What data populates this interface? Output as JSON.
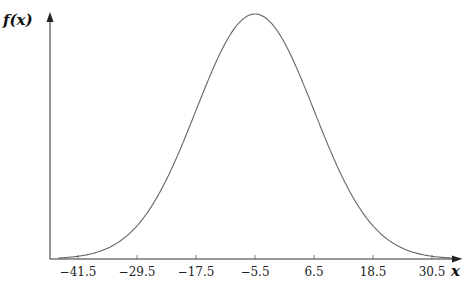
{
  "chart_data": {
    "type": "line",
    "title": "",
    "xlabel": "x",
    "ylabel": "f(x)",
    "x_ticks": [
      -41.5,
      -29.5,
      -17.5,
      -5.5,
      6.5,
      18.5,
      30.5
    ],
    "x_tick_labels": [
      "−41.5",
      "−29.5",
      "−17.5",
      "−5.5",
      "6.5",
      "18.5",
      "30.5"
    ],
    "xlim": [
      -45.5,
      36.5
    ],
    "grid": false,
    "legend": null,
    "series": [
      {
        "name": "normal density",
        "distribution": "normal",
        "mean": -5.5,
        "std": 12,
        "x": [
          -45.5,
          -41.5,
          -35.5,
          -29.5,
          -23.5,
          -17.5,
          -11.5,
          -5.5,
          0.5,
          6.5,
          12.5,
          18.5,
          24.5,
          30.5,
          36.5
        ],
        "y_relative": [
          0.004,
          0.011,
          0.044,
          0.135,
          0.325,
          0.607,
          0.882,
          1.0,
          0.882,
          0.607,
          0.325,
          0.135,
          0.044,
          0.011,
          0.004
        ]
      }
    ]
  },
  "labels": {
    "y_axis": "f(x)",
    "x_axis": "x"
  }
}
